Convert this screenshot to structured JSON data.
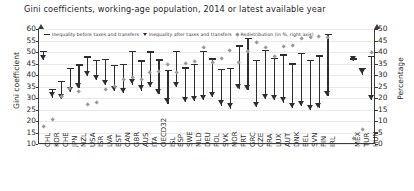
{
  "title": "Gini coefficients, working-age population, 2014 or latest available year",
  "axes": {
    "left_title": "Gini coefficient",
    "right_title": "Percentage",
    "left_ticks": [
      60,
      55,
      50,
      45,
      40,
      35,
      30,
      25,
      20,
      15,
      10
    ],
    "right_ticks": [
      50,
      45,
      40,
      35,
      30,
      25,
      20,
      15,
      10,
      5,
      0
    ],
    "left_min": 10,
    "left_max": 60,
    "right_min": 0,
    "right_max": 50
  },
  "legend": {
    "before_label": "Inequality before taxes and transfers",
    "after_label": "Inequality after taxes and transfers",
    "redistribution_label": "Redistribution (in %, right axis)"
  },
  "colors": {
    "series_dark": "#2e2e2e",
    "redistribution_gray": "#9a9a9a",
    "gridline": "#e9e9e9",
    "axis": "#3b3b3b"
  },
  "chart_data": {
    "type": "scatter",
    "title": "Gini coefficients, working-age population, 2014 or latest available year",
    "xlabel": "",
    "ylabel": "Gini coefficient",
    "y2label": "Percentage",
    "ylim": [
      10,
      60
    ],
    "y2lim": [
      0,
      50
    ],
    "grid": true,
    "legend_position": "top-left-inside",
    "categories": [
      "CHL",
      "KOR",
      "CHE",
      "JPN",
      "NZL",
      "USA",
      "ISR",
      "LVA",
      "EST",
      "CAN",
      "GBR",
      "AUS",
      "ITA",
      "OECD32",
      "ISL",
      "ESP",
      "SWE",
      "NLD",
      "DEU",
      "POL",
      "SVK",
      "NOR",
      "PRT",
      "GRC",
      "CZE",
      "FRA",
      "LUX",
      "AUT",
      "DNK",
      "BEL",
      "SVN",
      "FIN",
      "IRL",
      "MEX",
      "TUR",
      "HUN"
    ],
    "series": [
      {
        "name": "Inequality before taxes and transfers",
        "marker": "dash",
        "values": [
          50.3,
          33.8,
          37.1,
          42.8,
          44.3,
          47.8,
          46.2,
          46.6,
          44.2,
          44.7,
          50.2,
          46.1,
          50.0,
          46.5,
          42.1,
          50.3,
          43.1,
          44.5,
          50.1,
          47.0,
          42.3,
          42.7,
          52.6,
          56.0,
          46.3,
          50.5,
          47.2,
          48.7,
          44.8,
          49.3,
          46.2,
          48.3,
          57.5,
          47.0,
          42.9,
          48.1
        ]
      },
      {
        "name": "Inequality after taxes and transfers",
        "marker": "triangle-down",
        "values": [
          46.5,
          30.2,
          29.5,
          32.5,
          34.2,
          39.6,
          37.9,
          35.7,
          33.1,
          32.2,
          35.8,
          33.2,
          34.6,
          31.8,
          27.6,
          34.6,
          28.1,
          28.6,
          29.2,
          30.3,
          26.7,
          25.4,
          33.9,
          33.5,
          25.9,
          29.4,
          29.2,
          28.0,
          25.6,
          26.6,
          24.9,
          25.7,
          30.8,
          45.9,
          40.2,
          29.0
        ]
      },
      {
        "name": "Redistribution (in %, right axis)",
        "marker": "diamond",
        "axis": "right",
        "values": [
          7.6,
          10.7,
          20.5,
          24.1,
          22.8,
          17.2,
          18.0,
          23.4,
          25.1,
          28.0,
          28.7,
          28.0,
          30.8,
          31.6,
          34.4,
          31.2,
          34.8,
          35.7,
          41.7,
          35.5,
          36.9,
          40.5,
          35.5,
          40.2,
          44.1,
          41.8,
          38.1,
          42.5,
          42.9,
          46.0,
          46.1,
          46.8,
          46.4,
          2.3,
          6.3,
          39.7
        ]
      }
    ]
  }
}
